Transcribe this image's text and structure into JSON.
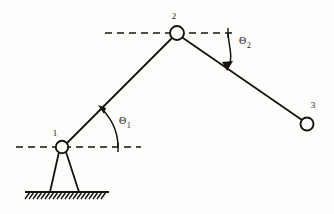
{
  "diagram": {
    "stroke_color": "#16130f",
    "background_color": "#fdfdfb",
    "joints": [
      {
        "id": "joint-1",
        "label": "1",
        "cx": 62,
        "cy": 147,
        "r": 6.2,
        "label_x": 55,
        "label_y": 136,
        "type": "grounded-pivot"
      },
      {
        "id": "joint-2",
        "label": "2",
        "cx": 177,
        "cy": 33,
        "r": 7.0,
        "label_x": 173,
        "label_y": 19,
        "type": "revolute"
      },
      {
        "id": "joint-3",
        "label": "3",
        "cx": 307,
        "cy": 124,
        "r": 6.5,
        "label_x": 312,
        "label_y": 108,
        "type": "end-effector"
      }
    ],
    "links": [
      {
        "id": "link-1",
        "from": "joint-1",
        "to": "joint-2",
        "x1": 67,
        "y1": 143,
        "x2": 172,
        "y2": 38
      },
      {
        "id": "link-2",
        "from": "joint-2",
        "to": "joint-3",
        "x1": 183,
        "y1": 38,
        "x2": 302,
        "y2": 120
      }
    ],
    "reference_lines": [
      {
        "id": "datum-line-joint-1",
        "y": 147,
        "x_start": 16,
        "x_end": 141,
        "style": "dashed"
      },
      {
        "id": "datum-line-joint-2",
        "y": 33,
        "x_start": 105,
        "x_end": 233,
        "style": "dashed"
      }
    ],
    "datum_ticks": [
      {
        "id": "tick-theta-1",
        "x": 118,
        "y_top": 143,
        "y_bottom": 152
      },
      {
        "id": "tick-theta-2",
        "x": 228,
        "y_top": 28,
        "y_bottom": 38
      }
    ],
    "angles": [
      {
        "id": "theta-1",
        "symbol": "Θ",
        "subscript": "1",
        "label_x": 119,
        "label_y": 124,
        "sub_x": 127,
        "sub_y": 128,
        "arc_path": "M 118 147 C 118 131 110 117 101 108",
        "arrow_tip_x": 99,
        "arrow_tip_y": 106,
        "arrow_angle_deg": 226,
        "measured_from": "datum-line-joint-1",
        "measured_to": "link-1"
      },
      {
        "id": "theta-2",
        "symbol": "Θ",
        "subscript": "2",
        "label_x": 239,
        "label_y": 44,
        "sub_x": 247,
        "sub_y": 48,
        "arc_path": "M 228 33 C 228 48 233 58 229 66",
        "arrow_tip_x": 227,
        "arrow_tip_y": 69,
        "arrow_angle_deg": 105,
        "measured_from": "datum-line-joint-2",
        "measured_to": "link-2"
      }
    ],
    "support": {
      "id": "ground-support",
      "leg_left": {
        "x1": 59,
        "y1": 153,
        "x2": 50,
        "y2": 192
      },
      "leg_right": {
        "x1": 66,
        "y1": 153,
        "x2": 79,
        "y2": 192
      },
      "ground_line": {
        "x_start": 25,
        "x_end": 109,
        "y": 192
      },
      "hatch_count": 19,
      "hatch_dx": -5,
      "hatch_dy": 7
    }
  }
}
